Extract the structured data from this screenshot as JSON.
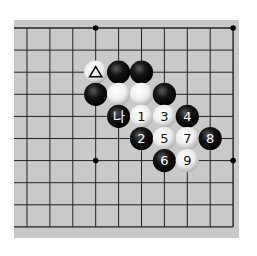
{
  "diagram": {
    "type": "go-board-fragment",
    "board": {
      "background": "#c9c9c9",
      "line_color": "#222222",
      "columns": 10,
      "rows": 10,
      "origin_x": 27,
      "origin_y": 28,
      "spacing_x": 22.9,
      "spacing_y": 22.1,
      "open_edges": [
        "left"
      ]
    },
    "star_points": [
      {
        "col": 3,
        "row": 0
      },
      {
        "col": 9,
        "row": 0
      },
      {
        "col": 3,
        "row": 6
      },
      {
        "col": 9,
        "row": 6
      }
    ],
    "stones": [
      {
        "col": 3,
        "row": 2,
        "color": "white",
        "label": "△"
      },
      {
        "col": 4,
        "row": 2,
        "color": "black",
        "label": ""
      },
      {
        "col": 5,
        "row": 2,
        "color": "black",
        "label": ""
      },
      {
        "col": 3,
        "row": 3,
        "color": "black",
        "label": ""
      },
      {
        "col": 4,
        "row": 3,
        "color": "white",
        "label": ""
      },
      {
        "col": 5,
        "row": 3,
        "color": "white",
        "label": ""
      },
      {
        "col": 6,
        "row": 3,
        "color": "black",
        "label": ""
      },
      {
        "col": 4,
        "row": 4,
        "color": "black",
        "label": "나"
      },
      {
        "col": 5,
        "row": 4,
        "color": "white",
        "label": "1"
      },
      {
        "col": 6,
        "row": 4,
        "color": "white",
        "label": "3"
      },
      {
        "col": 7,
        "row": 4,
        "color": "black",
        "label": "4"
      },
      {
        "col": 5,
        "row": 5,
        "color": "black",
        "label": "2"
      },
      {
        "col": 6,
        "row": 5,
        "color": "white",
        "label": "5"
      },
      {
        "col": 7,
        "row": 5,
        "color": "white",
        "label": "7"
      },
      {
        "col": 8,
        "row": 5,
        "color": "black",
        "label": "8"
      },
      {
        "col": 6,
        "row": 6,
        "color": "black",
        "label": "6"
      },
      {
        "col": 7,
        "row": 6,
        "color": "white",
        "label": "9"
      }
    ]
  }
}
